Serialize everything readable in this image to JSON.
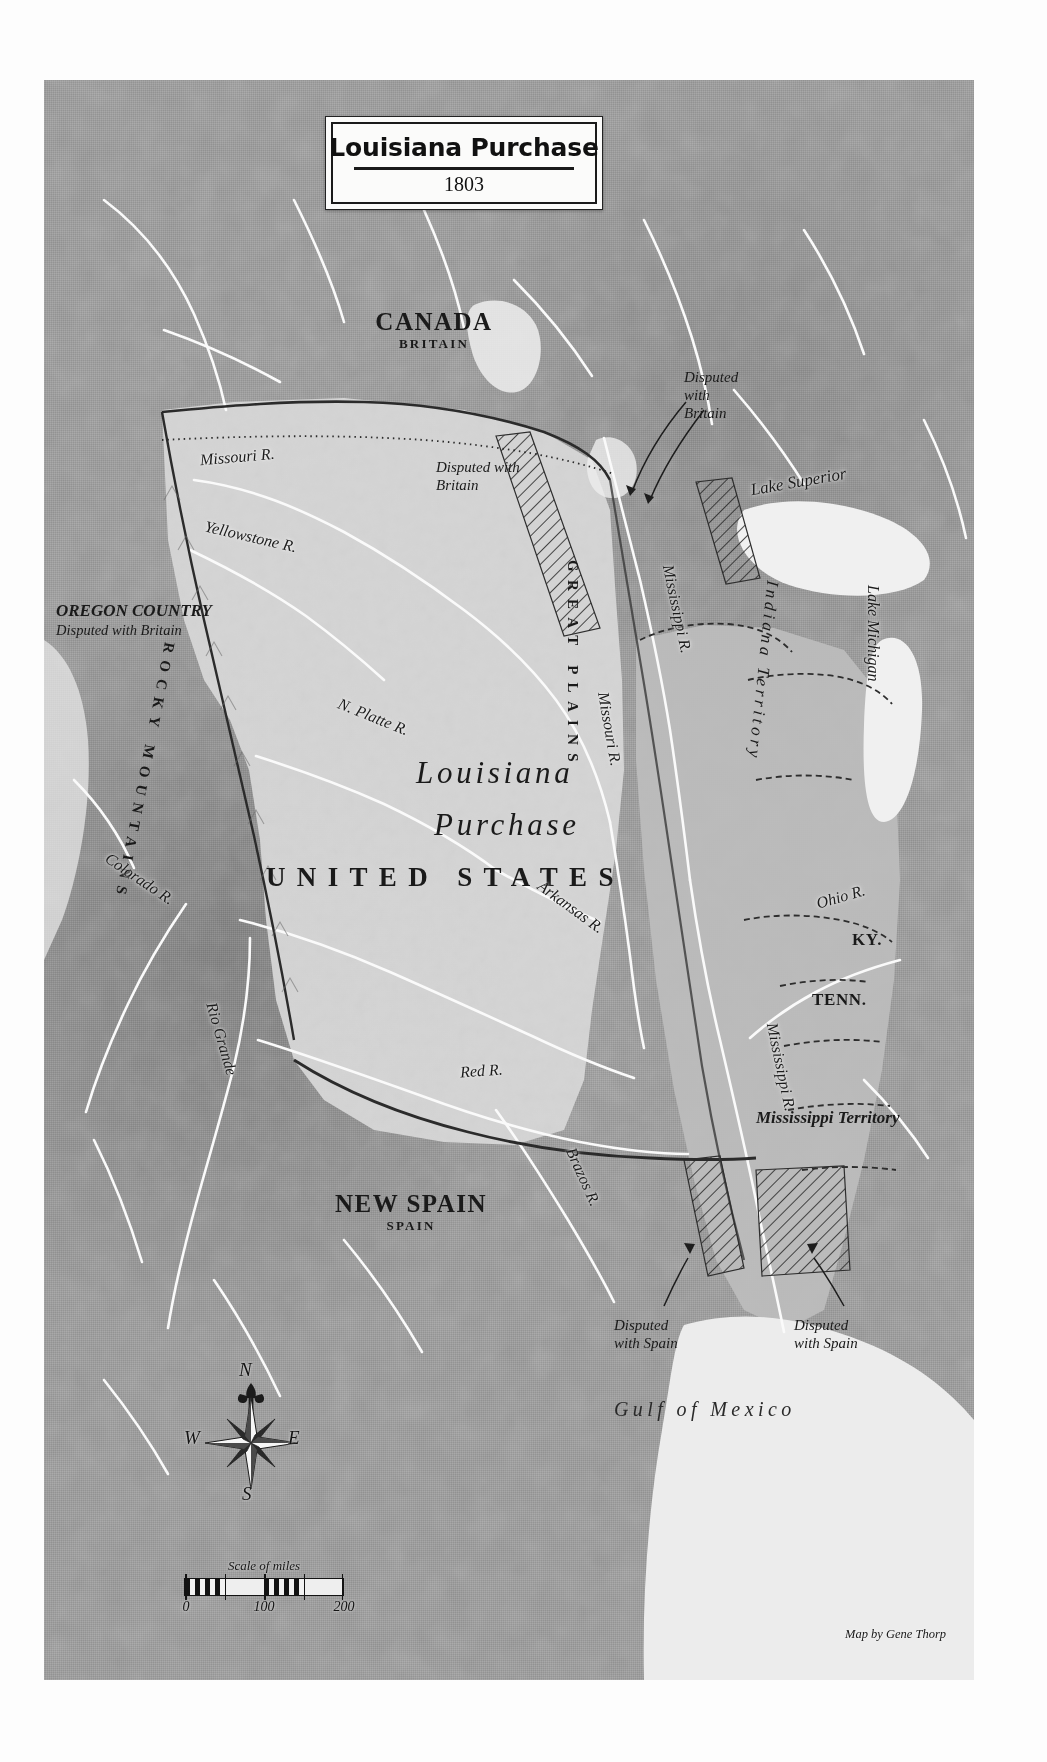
{
  "map": {
    "cartouche": {
      "title": "Louisiana Purchase",
      "year": "1803"
    },
    "credit": "Map by Gene Thorp",
    "scale": {
      "caption": "Scale of miles",
      "ticks": [
        "0",
        "100",
        "200"
      ],
      "units": "miles",
      "max": 200
    },
    "compass": {
      "north": "N",
      "south": "S",
      "east": "E",
      "west": "W"
    },
    "countries": [
      {
        "name": "CANADA",
        "sovereign": "BRITAIN"
      },
      {
        "name": "NEW SPAIN",
        "sovereign": "SPAIN"
      }
    ],
    "territories": [
      {
        "label": "OREGON COUNTRY",
        "note": "Disputed with Britain"
      },
      {
        "label": "Indiana Territory"
      },
      {
        "label": "Mississippi Territory"
      }
    ],
    "main_labels": {
      "purchase_line1": "Louisiana",
      "purchase_line2": "Purchase",
      "united_states": "UNITED STATES"
    },
    "states": [
      {
        "abbr": "KY."
      },
      {
        "abbr": "TENN."
      }
    ],
    "physiographic": [
      {
        "label": "GREAT PLAINS"
      },
      {
        "label": "ROCKY MOUNTAINS"
      }
    ],
    "water_features": [
      {
        "label": "Lake Superior"
      },
      {
        "label": "Lake Michigan"
      },
      {
        "label": "Gulf of Mexico"
      }
    ],
    "rivers": [
      {
        "label": "Missouri R."
      },
      {
        "label": "Yellowstone R."
      },
      {
        "label": "N. Platte R."
      },
      {
        "label": "Colorado R."
      },
      {
        "label": "Rio Grande"
      },
      {
        "label": "Arkansas R."
      },
      {
        "label": "Red R."
      },
      {
        "label": "Brazos R."
      },
      {
        "label": "Mississippi R."
      },
      {
        "label": "Missouri R."
      },
      {
        "label": "Mississippi R."
      },
      {
        "label": "Ohio R."
      }
    ],
    "disputed_zones": [
      {
        "label_line1": "Disputed",
        "label_line2": "with",
        "label_line3": "Britain"
      },
      {
        "label_line1": "Disputed with",
        "label_line2": "Britain"
      },
      {
        "label_line1": "Disputed",
        "label_line2": "with Spain"
      },
      {
        "label_line1": "Disputed",
        "label_line2": "with Spain"
      }
    ],
    "colors": {
      "land": "#9d9d9d",
      "purchase": "#d2d2d2",
      "united_states": "#b9b9b9",
      "water": "#efefef",
      "ink": "#1a1a1a",
      "paper": "#fbfbfa"
    }
  }
}
